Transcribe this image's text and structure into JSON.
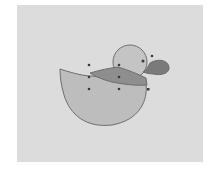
{
  "illustration": {
    "subject": "duck",
    "colors": {
      "background": "#dcdcdc",
      "body_fill": "#bdbdbd",
      "head_fill": "#c4c4c4",
      "scarf_fill": "#8e8e8e",
      "beak_fill": "#7a7a7a",
      "outline": "#6e6e6e",
      "handle": "#3a3a3a"
    },
    "anchor_points": [
      {
        "x": 89,
        "y": 65
      },
      {
        "x": 119,
        "y": 65
      },
      {
        "x": 89,
        "y": 77
      },
      {
        "x": 119,
        "y": 77
      },
      {
        "x": 89,
        "y": 89
      },
      {
        "x": 119,
        "y": 89
      },
      {
        "x": 143,
        "y": 61
      },
      {
        "x": 152,
        "y": 56
      },
      {
        "x": 148,
        "y": 89
      }
    ]
  }
}
